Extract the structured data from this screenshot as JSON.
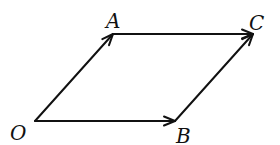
{
  "diagram": {
    "type": "vector-parallelogram",
    "points": {
      "O": {
        "label": "O",
        "x": 35,
        "y": 121,
        "label_x": 10,
        "label_y": 140
      },
      "A": {
        "label": "A",
        "x": 113,
        "y": 34,
        "label_x": 106,
        "label_y": 28
      },
      "B": {
        "label": "B",
        "x": 175,
        "y": 121,
        "label_x": 176,
        "label_y": 143
      },
      "C": {
        "label": "C",
        "x": 253,
        "y": 34,
        "label_x": 249,
        "label_y": 30
      }
    },
    "vectors": [
      {
        "id": "OA",
        "from": "O",
        "to": "A"
      },
      {
        "id": "OB",
        "from": "O",
        "to": "B"
      },
      {
        "id": "AC",
        "from": "A",
        "to": "C"
      },
      {
        "id": "BC",
        "from": "B",
        "to": "C"
      }
    ],
    "stroke_color": "#111111",
    "background": "#ffffff"
  }
}
